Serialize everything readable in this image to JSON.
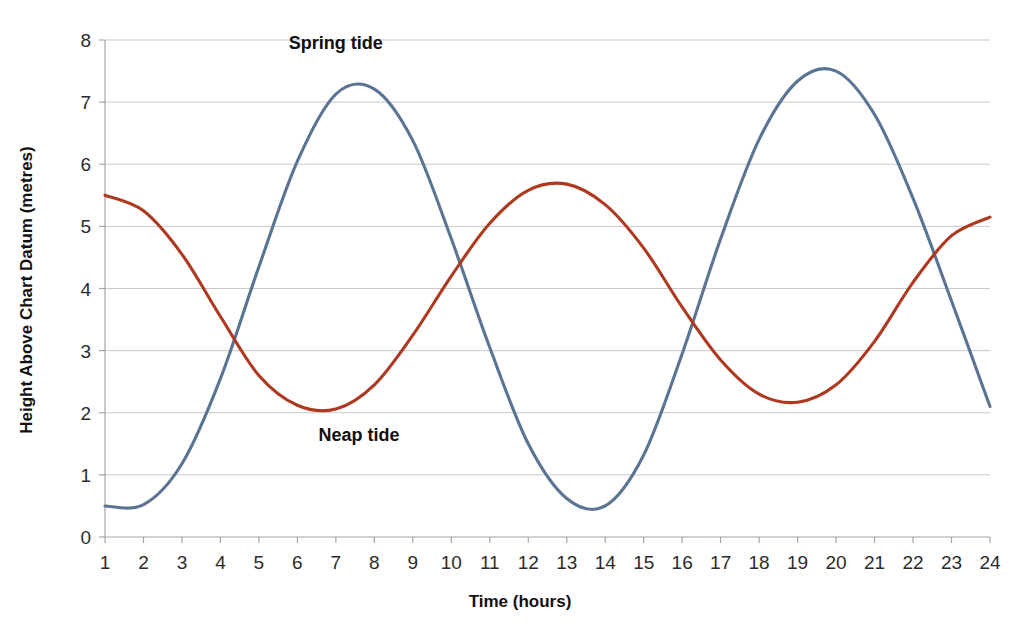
{
  "chart_data": {
    "type": "line",
    "title": "",
    "xlabel": "Time (hours)",
    "ylabel": "Height Above Chart Datum (metres)",
    "xlim": [
      1,
      24
    ],
    "ylim": [
      0,
      8
    ],
    "grid": true,
    "legend_position": "inline-annotations",
    "x_ticks": [
      "1",
      "2",
      "3",
      "4",
      "5",
      "6",
      "7",
      "8",
      "9",
      "10",
      "11",
      "12",
      "13",
      "14",
      "15",
      "16",
      "17",
      "18",
      "19",
      "20",
      "21",
      "22",
      "23",
      "24"
    ],
    "y_ticks": [
      "0",
      "1",
      "2",
      "3",
      "4",
      "5",
      "6",
      "7",
      "8"
    ],
    "x": [
      1,
      2,
      3,
      4,
      5,
      6,
      7,
      8,
      9,
      10,
      11,
      12,
      13,
      14,
      15,
      16,
      17,
      18,
      19,
      20,
      21,
      22,
      23,
      24
    ],
    "series": [
      {
        "name": "Spring tide",
        "color": "#5B7494",
        "annotation": "Spring tide",
        "annotation_x": 7.0,
        "annotation_y": 7.85,
        "values": [
          0.5,
          0.52,
          1.18,
          2.55,
          4.35,
          6.05,
          7.13,
          7.21,
          6.38,
          4.8,
          3.05,
          1.5,
          0.62,
          0.5,
          1.32,
          2.95,
          4.8,
          6.4,
          7.34,
          7.5,
          6.8,
          5.45,
          3.8,
          2.1
        ],
        "key_points": {
          "start_value": 0.5,
          "first_peak": {
            "x": 7.4,
            "y": 7.25
          },
          "trough": {
            "x": 13.8,
            "y": 0.5
          },
          "second_peak": {
            "x": 19.7,
            "y": 7.5
          },
          "end_value": 2.1
        }
      },
      {
        "name": "Neap tide",
        "color": "#AD3A20",
        "annotation": "Neap tide",
        "annotation_x": 7.6,
        "annotation_y": 1.55,
        "values": [
          5.5,
          5.25,
          4.55,
          3.55,
          2.6,
          2.12,
          2.06,
          2.45,
          3.25,
          4.2,
          5.05,
          5.58,
          5.68,
          5.35,
          4.65,
          3.7,
          2.85,
          2.3,
          2.17,
          2.45,
          3.15,
          4.1,
          4.85,
          5.15
        ],
        "key_points": {
          "start_value": 5.5,
          "first_trough": {
            "x": 6.5,
            "y": 2.05
          },
          "peak": {
            "x": 12.7,
            "y": 5.68
          },
          "second_trough": {
            "x": 19.0,
            "y": 2.17
          },
          "end_value": 5.15
        }
      }
    ]
  },
  "colors": {
    "spring_tide": "#5B7494",
    "neap_tide": "#AD3A20",
    "grid": "#c9c9c9",
    "axis": "#a6a6a6",
    "text": "#111111",
    "background": "#ffffff"
  }
}
